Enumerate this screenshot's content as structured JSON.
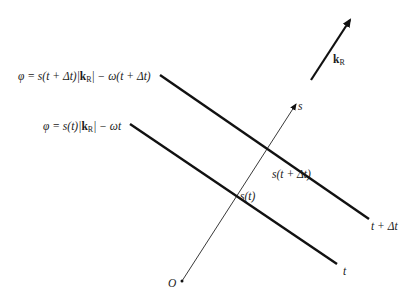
{
  "diagram": {
    "vector_label_main": "k",
    "vector_label_sub": "R",
    "axis_s_label": "s",
    "origin_label": "O",
    "wavefront_later": {
      "phase_prefix": "φ = s(t + Δt)|",
      "k": "k",
      "k_sub": "R",
      "phase_suffix": "| − ω(t + Δt)",
      "time_label": "t + Δt",
      "intersection_label": "s(t + Δt)"
    },
    "wavefront_now": {
      "phase_prefix": "φ = s(t)|",
      "k": "k",
      "k_sub": "R",
      "phase_suffix": "| − ωt",
      "time_label": "t",
      "intersection_label": "s(t)"
    },
    "colors": {
      "line": "#111111",
      "background": "#ffffff"
    }
  }
}
